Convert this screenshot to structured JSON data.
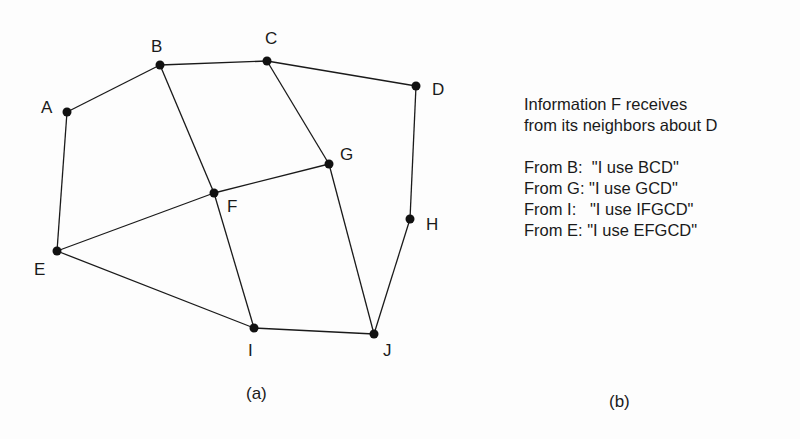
{
  "graph": {
    "nodes": [
      {
        "id": "A",
        "x": 67,
        "y": 112,
        "lx": 41,
        "ly": 113
      },
      {
        "id": "B",
        "x": 160,
        "y": 65,
        "lx": 151,
        "ly": 52
      },
      {
        "id": "C",
        "x": 267,
        "y": 61,
        "lx": 265,
        "ly": 44
      },
      {
        "id": "D",
        "x": 416,
        "y": 86,
        "lx": 432,
        "ly": 95
      },
      {
        "id": "E",
        "x": 57,
        "y": 251,
        "lx": 34,
        "ly": 275
      },
      {
        "id": "F",
        "x": 214,
        "y": 193,
        "lx": 227,
        "ly": 212
      },
      {
        "id": "G",
        "x": 329,
        "y": 164,
        "lx": 340,
        "ly": 160
      },
      {
        "id": "H",
        "x": 410,
        "y": 219,
        "lx": 426,
        "ly": 230
      },
      {
        "id": "I",
        "x": 254,
        "y": 328,
        "lx": 248,
        "ly": 356
      },
      {
        "id": "J",
        "x": 374,
        "y": 334,
        "lx": 383,
        "ly": 356
      }
    ],
    "edges": [
      [
        "A",
        "B"
      ],
      [
        "B",
        "C"
      ],
      [
        "C",
        "D"
      ],
      [
        "A",
        "E"
      ],
      [
        "B",
        "F"
      ],
      [
        "C",
        "G"
      ],
      [
        "F",
        "G"
      ],
      [
        "E",
        "F"
      ],
      [
        "F",
        "I"
      ],
      [
        "E",
        "I"
      ],
      [
        "I",
        "J"
      ],
      [
        "G",
        "J"
      ],
      [
        "D",
        "H"
      ],
      [
        "H",
        "J"
      ]
    ],
    "caption": "(a)"
  },
  "info": {
    "title_line1": "Information F receives",
    "title_line2": "from its neighbors about D",
    "lines": [
      "From B:  \"I use BCD\"",
      "From G: \"I use GCD\"",
      "From I:   \"I use IFGCD\"",
      "From E: \"I use EFGCD\""
    ],
    "caption": "(b)"
  }
}
